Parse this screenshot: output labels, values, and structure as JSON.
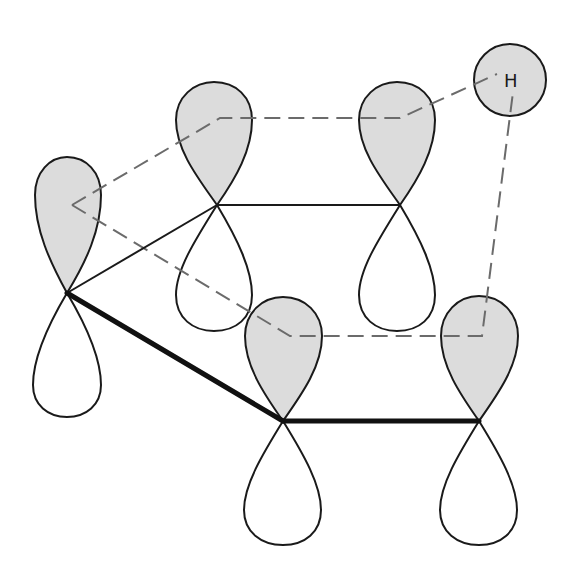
{
  "diagram": {
    "colors": {
      "shaded_lobe": "#dcdcdc",
      "outline": "#1a1a1a",
      "dashed_line": "#6b6b6b",
      "background": "#ffffff"
    },
    "hydrogen": {
      "label": "H",
      "cx": 510,
      "cy": 80,
      "r": 36
    },
    "orbitals": [
      {
        "id": "p1",
        "node": [
          67,
          293
        ],
        "upper_lobe_shaded": true
      },
      {
        "id": "p2",
        "node": [
          217,
          205
        ],
        "upper_lobe_shaded": true
      },
      {
        "id": "p3",
        "node": [
          400,
          205
        ],
        "upper_lobe_shaded": true
      },
      {
        "id": "p4",
        "node": [
          283,
          421
        ],
        "upper_lobe_shaded": true
      },
      {
        "id": "p5",
        "node": [
          479,
          421
        ],
        "upper_lobe_shaded": true
      }
    ],
    "bonds": [
      {
        "from": "p1",
        "to": "p2",
        "style": "thin"
      },
      {
        "from": "p2",
        "to": "p3",
        "style": "thin"
      },
      {
        "from": "p1",
        "to": "p4",
        "style": "thick"
      },
      {
        "from": "p4",
        "to": "p5",
        "style": "thick"
      }
    ],
    "dashed_outline": [
      [
        72,
        205
      ],
      [
        220,
        118
      ],
      [
        400,
        118
      ],
      [
        497,
        74
      ],
      [
        513,
        92
      ],
      [
        482,
        336
      ],
      [
        290,
        336
      ],
      [
        72,
        205
      ]
    ]
  }
}
